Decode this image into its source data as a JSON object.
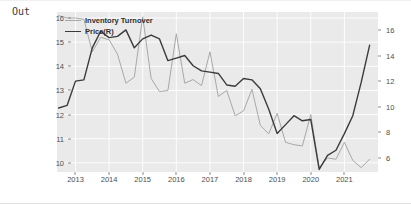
{
  "notebook": {
    "out_label": "Out"
  },
  "chart_data": {
    "type": "line",
    "title": "",
    "xlabel": "",
    "ylabel": "",
    "grid": true,
    "legend_position": "upper-left",
    "plot_background": "#eaeaea",
    "gridline_color": "#ffffff",
    "x_axis": {
      "tick_labels": [
        "2013",
        "2014",
        "2015",
        "2016",
        "2017",
        "2018",
        "2019",
        "2020",
        "2021"
      ],
      "tick_values": [
        2013,
        2014,
        2015,
        2016,
        2017,
        2018,
        2019,
        2020,
        2021
      ],
      "range": [
        2012.45,
        2022.0
      ]
    },
    "y_axis_left": {
      "label": "Inventory Turnover",
      "tick_labels": [
        "10",
        "11",
        "12",
        "13",
        "14",
        "15",
        "16"
      ],
      "tick_values": [
        10,
        11,
        12,
        13,
        14,
        15,
        16
      ],
      "range": [
        9.62,
        16.25
      ]
    },
    "y_axis_right": {
      "label": "Price(R)",
      "tick_labels": [
        "6",
        "8",
        "10",
        "12",
        "14",
        "16"
      ],
      "tick_values": [
        6,
        8,
        10,
        12,
        14,
        16
      ],
      "range": [
        4.9,
        17.4
      ]
    },
    "series": [
      {
        "name": "Inventory Turnover",
        "axis": "left",
        "color": "#a8a8a8",
        "line_width": 1.0,
        "x": [
          2012.5,
          2012.75,
          2013.0,
          2013.25,
          2013.5,
          2013.75,
          2014.0,
          2014.25,
          2014.5,
          2014.75,
          2015.0,
          2015.25,
          2015.5,
          2015.75,
          2016.0,
          2016.25,
          2016.5,
          2016.75,
          2017.0,
          2017.25,
          2017.5,
          2017.75,
          2018.0,
          2018.25,
          2018.5,
          2018.75,
          2019.0,
          2019.25,
          2019.5,
          2019.75,
          2020.0,
          2020.25,
          2020.5,
          2020.75,
          2021.0,
          2021.25,
          2021.5,
          2021.75
        ],
        "y": [
          16.1,
          16.0,
          16.0,
          15.95,
          14.6,
          15.2,
          15.1,
          14.5,
          13.3,
          13.55,
          16.05,
          13.5,
          12.95,
          13.0,
          15.35,
          13.3,
          13.45,
          13.2,
          14.6,
          12.75,
          13.0,
          11.95,
          12.15,
          13.05,
          11.55,
          11.2,
          12.05,
          10.85,
          10.75,
          10.7,
          12.0,
          9.8,
          10.2,
          10.15,
          10.85,
          10.1,
          9.8,
          10.15
        ]
      },
      {
        "name": "Price(R)",
        "axis": "right",
        "color": "#3b3b3b",
        "line_width": 1.4,
        "x": [
          2012.5,
          2012.75,
          2013.0,
          2013.25,
          2013.5,
          2013.75,
          2014.0,
          2014.25,
          2014.5,
          2014.75,
          2015.0,
          2015.25,
          2015.5,
          2015.75,
          2016.0,
          2016.25,
          2016.5,
          2016.75,
          2017.0,
          2017.25,
          2017.5,
          2017.75,
          2018.0,
          2018.25,
          2018.5,
          2018.75,
          2019.0,
          2019.25,
          2019.5,
          2019.75,
          2020.0,
          2020.25,
          2020.5,
          2020.75,
          2021.0,
          2021.25,
          2021.5,
          2021.75
        ],
        "y": [
          9.9,
          10.1,
          12.0,
          12.1,
          14.6,
          15.9,
          15.4,
          15.5,
          16.0,
          14.6,
          15.3,
          15.6,
          15.3,
          13.6,
          13.8,
          14.0,
          13.2,
          12.8,
          12.7,
          12.6,
          11.7,
          11.6,
          12.2,
          12.1,
          11.4,
          9.8,
          7.9,
          8.6,
          9.3,
          8.9,
          9.0,
          5.1,
          6.2,
          6.6,
          7.9,
          9.3,
          11.9,
          14.8
        ]
      }
    ]
  }
}
